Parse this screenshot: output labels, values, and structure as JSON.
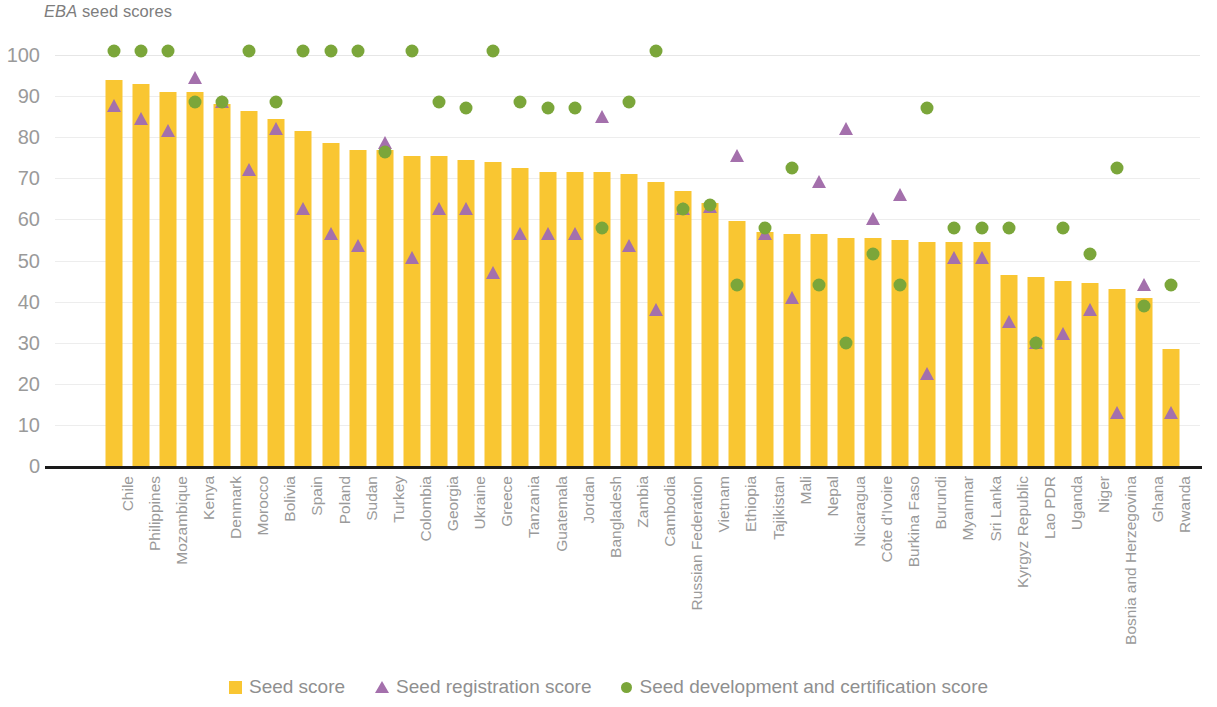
{
  "chart_data": {
    "type": "bar",
    "title": "EBA seed scores",
    "title_italic_part": "EBA",
    "title_rest": " seed scores",
    "xlabel": "",
    "ylabel": "",
    "ylim": [
      0,
      100
    ],
    "yticks": [
      0,
      10,
      20,
      30,
      40,
      50,
      60,
      70,
      80,
      90,
      100
    ],
    "grid": true,
    "legend_position": "bottom",
    "colors": {
      "seed_score": "#f9c632",
      "seed_registration_score": "#a470ac",
      "seed_development_and_certification_score": "#7ba63a",
      "axis_text": "#9a9a9a",
      "baseline": "#1a1a1a",
      "gridline": "#ededed",
      "background": "#ffffff"
    },
    "categories": [
      "Chile",
      "Philippines",
      "Mozambique",
      "Kenya",
      "Denmark",
      "Morocco",
      "Bolivia",
      "Spain",
      "Poland",
      "Sudan",
      "Turkey",
      "Colombia",
      "Georgia",
      "Ukraine",
      "Greece",
      "Tanzania",
      "Guatemala",
      "Jordan",
      "Bangladesh",
      "Zambia",
      "Cambodia",
      "Russian Federation",
      "Vietnam",
      "Ethiopia",
      "Tajikistan",
      "Mali",
      "Nepal",
      "Nicaragua",
      "Côte d'Ivoire",
      "Burkina Faso",
      "Burundi",
      "Myanmar",
      "Sri Lanka",
      "Kyrgyz Republic",
      "Lao PDR",
      "Uganda",
      "Niger",
      "Bosnia and Herzegovina",
      "Ghana",
      "Rwanda"
    ],
    "series": [
      {
        "name": "Seed score",
        "marker": "bar",
        "color": "#f9c632",
        "values": [
          94,
          93,
          91,
          91,
          88,
          86.5,
          84.5,
          81.5,
          78.5,
          77,
          77,
          75.5,
          75.5,
          74.5,
          74,
          72.5,
          71.5,
          71.5,
          71.5,
          71,
          69,
          67,
          64,
          59.5,
          57,
          56.5,
          56.5,
          55.5,
          55.5,
          55,
          54.5,
          54.5,
          54.5,
          46.5,
          46,
          45,
          44.5,
          43,
          41,
          28.5
        ]
      },
      {
        "name": "Seed registration score",
        "marker": "triangle",
        "color": "#a470ac",
        "values": [
          87.5,
          84.5,
          81.5,
          94.5,
          88.5,
          72,
          82,
          62.5,
          56.5,
          53.5,
          78.5,
          50.5,
          62.5,
          62.5,
          47,
          56.5,
          56.5,
          56.5,
          85,
          53.5,
          38,
          62.5,
          63,
          75.5,
          56.5,
          41,
          69,
          82,
          60,
          66,
          22.5,
          50.5,
          50.5,
          35,
          30,
          32,
          38,
          13,
          44,
          13
        ]
      },
      {
        "name": "Seed development and certification score",
        "marker": "circle",
        "color": "#7ba63a",
        "values": [
          101,
          101,
          101,
          88.5,
          88.5,
          101,
          88.5,
          101,
          101,
          101,
          76.5,
          101,
          88.5,
          87,
          101,
          88.5,
          87,
          87,
          58,
          88.5,
          101,
          62.5,
          63.5,
          44,
          58,
          72.5,
          44,
          30,
          51.5,
          44,
          87,
          58,
          58,
          58,
          30,
          58,
          51.5,
          72.5,
          39,
          44
        ]
      }
    ]
  },
  "legend": {
    "items": [
      {
        "label": "Seed score",
        "shape": "square"
      },
      {
        "label": "Seed registration score",
        "shape": "triangle"
      },
      {
        "label": "Seed development and certification score",
        "shape": "circle"
      }
    ]
  }
}
